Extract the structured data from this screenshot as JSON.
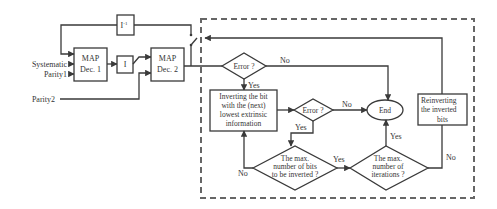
{
  "diagram": {
    "inputs": {
      "systematic": "Systematic",
      "parity1": "Parity1",
      "parity2": "Parity2"
    },
    "blocks": {
      "map_dec1": {
        "line1": "MAP",
        "line2": "Dec. 1"
      },
      "interleaver": {
        "label": "I"
      },
      "deinterleaver": {
        "label": "I",
        "superscript": "-1"
      },
      "map_dec2": {
        "line1": "MAP",
        "line2": "Dec. 2"
      }
    },
    "flowchart": {
      "error1": {
        "label": "Error ?",
        "no": "No",
        "yes": "Yes"
      },
      "inverting": {
        "line1": "Inverting the bit",
        "line2": "with the (next)",
        "line3": "lowest extrinsic",
        "line4": "information"
      },
      "error2": {
        "label": "Error ?",
        "no": "No",
        "yes": "Yes"
      },
      "end": {
        "label": "End"
      },
      "reinverting": {
        "line1": "Reinverting",
        "line2": "the inverted",
        "line3": "bits"
      },
      "max_bits": {
        "line1": "The max.",
        "line2": "number of bits",
        "line3": "to be inverted ?",
        "yes": "Yes",
        "no": "No"
      },
      "max_iter": {
        "line1": "The max.",
        "line2": "number of",
        "line3": "iterations ?",
        "yes": "Yes",
        "no": "No"
      }
    },
    "colors": {
      "line": "#3a3a3a",
      "dashed_border": "#666666",
      "text": "#333333",
      "background": "#ffffff"
    }
  }
}
